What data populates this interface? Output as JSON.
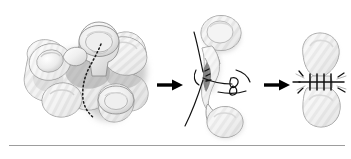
{
  "figure": {
    "title": "Pars interarticularis defect repair sequence",
    "background_color": "#ffffff",
    "width": 351,
    "height": 159,
    "panel_count": 3,
    "arrow_count": 2
  },
  "palette": {
    "bone_fill": "#f2f2f2",
    "bone_fill_light": "#fafafa",
    "bone_outline": "#8a8a8a",
    "bone_shadow": "#b8b8b8",
    "deep_shadow": "#9a9a9a",
    "hatch_gray": "#dcdcdc",
    "suture_black": "#111111",
    "arrow_black": "#000000",
    "rule_gray": "#9d9d9d",
    "defect_dark": "#6e6e6e"
  },
  "panels": [
    {
      "id": "panel-vertebra",
      "index": 1,
      "name": "vertebra-with-defect",
      "caption": "",
      "annotation": "dotted-osteotomy-line",
      "elements": [
        "superior-articular-process",
        "transverse-process-left",
        "transverse-process-right",
        "inferior-articular-process",
        "lamina",
        "pars-interarticularis-defect"
      ]
    },
    {
      "id": "panel-suture-placement",
      "index": 2,
      "name": "isolated-segment-suture-placement",
      "caption": "",
      "annotation": "suture-strands-and-knot-loop",
      "elements": [
        "superior-bone-segment",
        "inferior-bone-segment",
        "defect-gap",
        "suture-strand-upper-left",
        "suture-strand-lower-left",
        "suture-strand-right",
        "suture-knot-loop"
      ]
    },
    {
      "id": "panel-completed-repair",
      "index": 3,
      "name": "completed-repair",
      "caption": "",
      "annotation": "multiple-parallel-sutures",
      "elements": [
        "superior-bone-segment",
        "inferior-bone-segment",
        "suture-row"
      ],
      "suture_count": 4
    }
  ],
  "arrows": [
    {
      "id": "arrow-1",
      "direction": "right",
      "from_panel": 1,
      "to_panel": 2
    },
    {
      "id": "arrow-2",
      "direction": "right",
      "from_panel": 2,
      "to_panel": 3
    }
  ],
  "rule": {
    "visible": true,
    "orientation": "horizontal",
    "position": "bottom"
  }
}
